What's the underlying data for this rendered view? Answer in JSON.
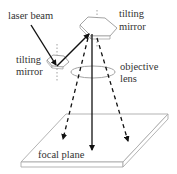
{
  "diagram": {
    "labels": {
      "laser_beam": "laser beam",
      "tilting_mirror_left_line1": "tilting",
      "tilting_mirror_left_line2": "mirror",
      "tilting_mirror_top_line1": "tilting",
      "tilting_mirror_top_line2": "mirror",
      "objective_lens_line1": "objective",
      "objective_lens_line2": "lens",
      "focal_plane": "focal plane"
    },
    "colors": {
      "line": "#111111",
      "outline": "#999999",
      "text": "#333333",
      "background": "#ffffff"
    }
  }
}
